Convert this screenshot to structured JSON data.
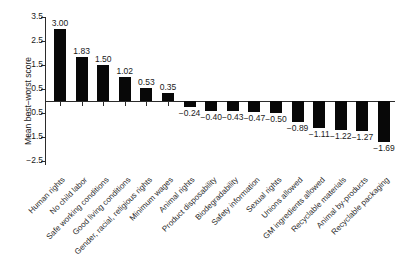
{
  "chart_data": {
    "type": "bar",
    "title": "",
    "xlabel": "",
    "ylabel": "Mean best–worst score",
    "ylim": [
      -2.5,
      3.5
    ],
    "yticks": [
      3.5,
      2.5,
      1.5,
      0.5,
      -0.5,
      -1.5,
      -2.5
    ],
    "ytick_labels": [
      "3.5",
      "2.5",
      "1.5",
      "0.5",
      "−0.5",
      "−1.5",
      "−2.5"
    ],
    "grid": false,
    "legend": null,
    "bar_color": "#080808",
    "categories": [
      "Human rights",
      "No child labor",
      "Safe working conditions",
      "Good living conditions",
      "Gender, racial, religious rights",
      "Minimum wages",
      "Animal rights",
      "Product disposability",
      "Biodegradability",
      "Safety information",
      "Sexual rights",
      "Unions allowed",
      "GM ingredients allowed",
      "Recyclable materials",
      "Animal by-products",
      "Recyclable packaging"
    ],
    "values": [
      3.0,
      1.83,
      1.5,
      1.02,
      0.53,
      0.35,
      -0.24,
      -0.4,
      -0.43,
      -0.47,
      -0.5,
      -0.89,
      -1.11,
      -1.22,
      -1.27,
      -1.69
    ],
    "value_labels": [
      "3.00",
      "1.83",
      "1.50",
      "1.02",
      "0.53",
      "0.35",
      "−0.24",
      "−0.40",
      "−0.43",
      "−0.47",
      "−0.50",
      "−0.89",
      "−1.11",
      "−1.22",
      "−1.27",
      "−1.69"
    ]
  }
}
